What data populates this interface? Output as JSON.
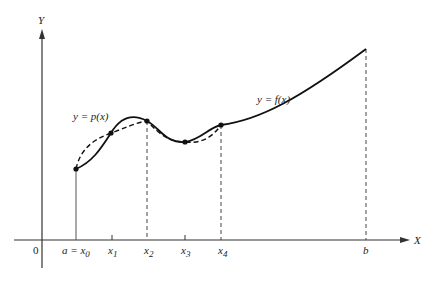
{
  "diagram": {
    "type": "interpolation-illustration",
    "axes": {
      "x_label": "X",
      "y_label": "Y",
      "origin_label": "0"
    },
    "curves": [
      {
        "name": "f",
        "label": "y = f(x)",
        "style": "solid"
      },
      {
        "name": "p",
        "label": "y = p(x)",
        "style": "dashed"
      }
    ],
    "x_ticks": [
      {
        "main": "a = x",
        "sub": "0"
      },
      {
        "main": "x",
        "sub": "1"
      },
      {
        "main": "x",
        "sub": "2"
      },
      {
        "main": "x",
        "sub": "3"
      },
      {
        "main": "x",
        "sub": "4"
      },
      {
        "main": "b",
        "sub": ""
      }
    ],
    "interpolation_nodes": [
      "x0",
      "x1",
      "x2",
      "x3",
      "x4"
    ],
    "colors": {
      "ink": "#222222",
      "axis": "#333333",
      "background": "#ffffff"
    }
  }
}
